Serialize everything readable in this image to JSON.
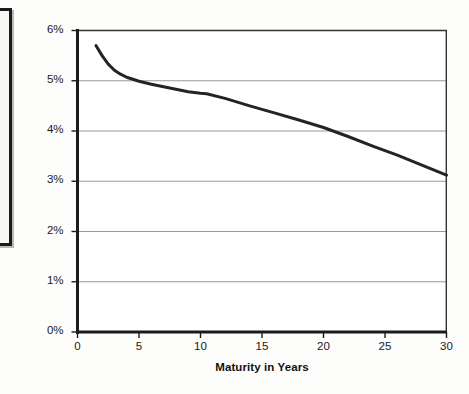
{
  "figure": {
    "background_color": "#fdfdfb",
    "ink_color": "#1b1b1b",
    "gridline_color": "#9a9a9a",
    "series_color": "#242424"
  },
  "side_panel": {
    "name": "cropped-adjacent-panel",
    "visible_text": ""
  },
  "chart_data": {
    "type": "line",
    "title": "",
    "xlabel": "Maturity in Years",
    "ylabel": "Yield to Maturity",
    "xlim": [
      0,
      30
    ],
    "ylim": [
      0,
      6
    ],
    "grid": true,
    "grid_axis": "y",
    "legend": false,
    "legend_position": "none",
    "x_ticks": [
      0,
      5,
      10,
      15,
      20,
      25,
      30
    ],
    "x_tick_labels": [
      "0",
      "5",
      "10",
      "15",
      "20",
      "25",
      "30"
    ],
    "y_ticks": [
      0,
      1,
      2,
      3,
      4,
      5,
      6
    ],
    "y_tick_labels": [
      "0%",
      "1%",
      "2%",
      "3%",
      "4%",
      "5%",
      "6%"
    ],
    "y_unit": "percent",
    "series": [
      {
        "name": "Yield curve",
        "color": "#242424",
        "line_width": 3,
        "x": [
          1.5,
          2.0,
          2.5,
          3.0,
          3.5,
          4.0,
          5.0,
          6.0,
          7.0,
          8.0,
          9.0,
          10.0,
          10.5,
          12.0,
          14.0,
          16.0,
          18.0,
          20.0,
          22.0,
          24.0,
          26.0,
          28.0,
          30.0
        ],
        "values": [
          5.7,
          5.5,
          5.33,
          5.21,
          5.13,
          5.07,
          4.99,
          4.93,
          4.88,
          4.83,
          4.78,
          4.75,
          4.74,
          4.65,
          4.5,
          4.36,
          4.22,
          4.07,
          3.89,
          3.7,
          3.52,
          3.32,
          3.12
        ]
      }
    ]
  }
}
